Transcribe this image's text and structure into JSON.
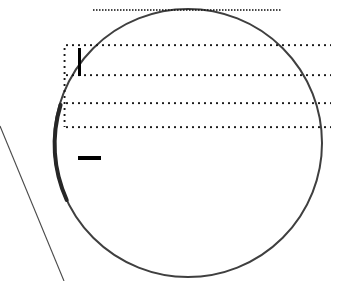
{
  "figure": {
    "title": "Circle with dotted guide lines and tick marks",
    "width": 341,
    "height": 281,
    "background_color": "#ffffff",
    "stroke_color": "#3a3a3a",
    "dot_color": "#1a1a1a",
    "mark_color": "#000000"
  },
  "circle": {
    "name": "large circle outline",
    "center_x": 188,
    "center_y": 143,
    "radius": 134,
    "stroke_color": "#3f3f3f",
    "stroke_width": 2.0,
    "fill": "none",
    "note": "top of circle is cropped by the top edge of the frame"
  },
  "circle_highlight": {
    "name": "thickened left arc segment",
    "stroke_color": "#2a2a2a",
    "stroke_width": 4.0,
    "start_angle_deg": 163,
    "end_angle_deg": 205
  },
  "tangent_line": {
    "name": "thin diagonal line from left edge",
    "x1": 0,
    "y1": 126,
    "x2": 64,
    "y2": 281,
    "stroke_color": "#4a4a4a",
    "stroke_width": 1.0
  },
  "top_dotted_line": {
    "name": "fine dotted chord near top",
    "x1": 93,
    "x2": 281,
    "y": 10,
    "dot_pitch": 3,
    "dot_size": 1.4,
    "color": "#1a1a1a"
  },
  "dotted_box": {
    "name": "dotted rectangular region",
    "left": 64,
    "right": 331,
    "top": 45,
    "bottom": 127,
    "dot_pitch": 6,
    "dot_size": 1.8,
    "color": "#1a1a1a",
    "horizontal_rules": [
      {
        "label": "rule-1",
        "y": 45,
        "x1": 64,
        "x2": 331
      },
      {
        "label": "rule-2",
        "y": 75,
        "x1": 64,
        "x2": 331
      },
      {
        "label": "rule-3",
        "y": 103,
        "x1": 64,
        "x2": 331
      },
      {
        "label": "rule-4",
        "y": 127,
        "x1": 64,
        "x2": 331
      }
    ],
    "vertical_rules": [
      {
        "label": "left-edge",
        "x": 64,
        "y1": 45,
        "y2": 127
      }
    ]
  },
  "marks": [
    {
      "name": "vertical-bar-mark",
      "kind": "vertical bar",
      "x": 79,
      "y_top": 48,
      "y_bottom": 76,
      "thickness": 3,
      "color": "#000000",
      "glyph": "|"
    },
    {
      "name": "horizontal-dash-mark",
      "kind": "horizontal dash",
      "x_left": 78,
      "x_right": 100,
      "y": 158,
      "thickness": 4,
      "color": "#000000",
      "glyph": "—"
    }
  ],
  "labels": {
    "figure_caption": "Circle with dotted guide lines and tick marks",
    "circle_label": "circle",
    "box_label": "dotted box",
    "bar_label": "vertical bar",
    "dash_label": "horizontal dash",
    "line_label": "diagonal line"
  }
}
